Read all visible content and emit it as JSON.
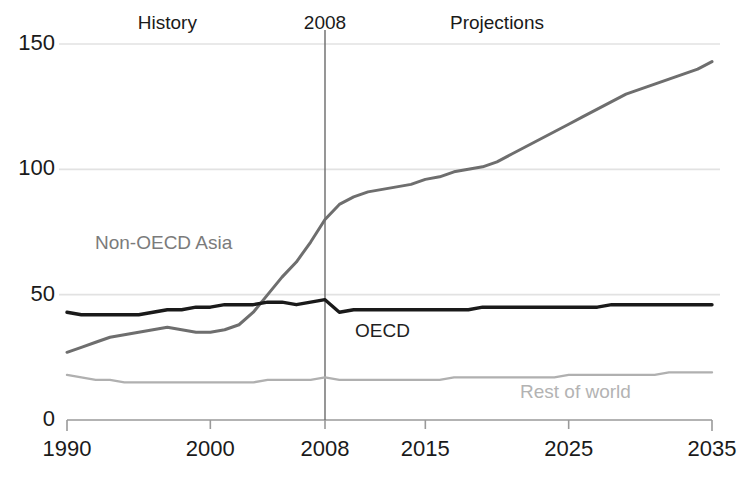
{
  "chart_data": {
    "type": "line",
    "title": "",
    "xlabel": "",
    "ylabel": "",
    "xlim": [
      1990,
      2035
    ],
    "ylim": [
      0,
      150
    ],
    "grid": true,
    "legend_position": "inline-annotations",
    "x_ticks": [
      "1990",
      "2000",
      "2008",
      "2015",
      "2025",
      "2035"
    ],
    "x_tick_values": [
      1990,
      2000,
      2008,
      2015,
      2025,
      2035
    ],
    "y_ticks": [
      "0",
      "50",
      "100",
      "150"
    ],
    "y_tick_values": [
      0,
      50,
      100,
      150
    ],
    "annotations": [
      {
        "text": "History",
        "x": 1997
      },
      {
        "text": "2008",
        "x": 2008
      },
      {
        "text": "Projections",
        "x": 2020
      }
    ],
    "divider_year": 2008,
    "x": [
      1990,
      1991,
      1992,
      1993,
      1994,
      1995,
      1996,
      1997,
      1998,
      1999,
      2000,
      2001,
      2002,
      2003,
      2004,
      2005,
      2006,
      2007,
      2008,
      2009,
      2010,
      2011,
      2012,
      2013,
      2014,
      2015,
      2016,
      2017,
      2018,
      2019,
      2020,
      2021,
      2022,
      2023,
      2024,
      2025,
      2026,
      2027,
      2028,
      2029,
      2030,
      2031,
      2032,
      2033,
      2034,
      2035
    ],
    "series": [
      {
        "name": "Non-OECD Asia",
        "color": "#6e6e6e",
        "label_color": "#7b7b7b",
        "values": [
          27,
          29,
          31,
          33,
          34,
          35,
          36,
          37,
          36,
          35,
          35,
          36,
          38,
          43,
          50,
          57,
          63,
          71,
          80,
          86,
          89,
          91,
          92,
          93,
          94,
          96,
          97,
          99,
          100,
          101,
          103,
          106,
          109,
          112,
          115,
          118,
          121,
          124,
          127,
          130,
          132,
          134,
          136,
          138,
          140,
          143
        ]
      },
      {
        "name": "OECD",
        "color": "#1a1a1a",
        "label_color": "#1f1f1f",
        "values": [
          43,
          42,
          42,
          42,
          42,
          42,
          43,
          44,
          44,
          45,
          45,
          46,
          46,
          46,
          47,
          47,
          46,
          47,
          48,
          43,
          44,
          44,
          44,
          44,
          44,
          44,
          44,
          44,
          44,
          45,
          45,
          45,
          45,
          45,
          45,
          45,
          45,
          45,
          46,
          46,
          46,
          46,
          46,
          46,
          46,
          46
        ]
      },
      {
        "name": "Rest of world",
        "color": "#b0b0b0",
        "label_color": "#b3b3b3",
        "values": [
          18,
          17,
          16,
          16,
          15,
          15,
          15,
          15,
          15,
          15,
          15,
          15,
          15,
          15,
          16,
          16,
          16,
          16,
          17,
          16,
          16,
          16,
          16,
          16,
          16,
          16,
          16,
          17,
          17,
          17,
          17,
          17,
          17,
          17,
          17,
          18,
          18,
          18,
          18,
          18,
          18,
          18,
          19,
          19,
          19,
          19
        ]
      }
    ]
  },
  "axis_labels": {
    "y": [
      {
        "text": "150",
        "value": 150
      },
      {
        "text": "100",
        "value": 100
      },
      {
        "text": "50",
        "value": 50
      },
      {
        "text": "0",
        "value": 0
      }
    ],
    "x": [
      {
        "text": "1990",
        "value": 1990
      },
      {
        "text": "2000",
        "value": 2000
      },
      {
        "text": "2008",
        "value": 2008
      },
      {
        "text": "2015",
        "value": 2015
      },
      {
        "text": "2025",
        "value": 2025
      },
      {
        "text": "2035",
        "value": 2035
      }
    ]
  },
  "top_annotations": {
    "history": "History",
    "divider_year": "2008",
    "projections": "Projections"
  },
  "series_labels": {
    "non_oecd_asia": "Non-OECD Asia",
    "oecd": "OECD",
    "rest_of_world": "Rest of world"
  },
  "colors": {
    "non_oecd_asia": "#6e6e6e",
    "oecd": "#1a1a1a",
    "rest_of_world": "#b0b0b0",
    "gridline": "#e2e2e2",
    "axis": "#9a9a9a",
    "divider": "#6a6a6a",
    "text": "#1a1a1a"
  }
}
